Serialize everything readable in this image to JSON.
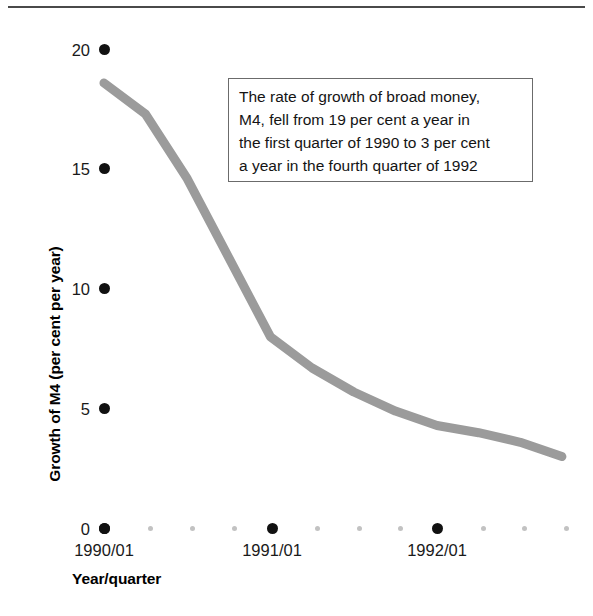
{
  "figure": {
    "has_top_rule": true,
    "background_color": "#ffffff",
    "line_color": "#9b9b9b",
    "major_dot_color": "#111111",
    "minor_dot_color": "#c2c2c2",
    "callout_border_color": "#6b6b6b"
  },
  "callout": {
    "lines": [
      "The rate of growth of broad money,",
      "M4, fell from 19 per cent a year in",
      "the first quarter of 1990 to 3 per cent",
      "a year in the fourth quarter of 1992"
    ]
  },
  "chart_data": {
    "type": "line",
    "title": "",
    "xlabel": "Year/quarter",
    "ylabel": "Growth of M4 (per cent per year)",
    "ylim": [
      0,
      20
    ],
    "yticks": [
      0,
      5,
      10,
      15,
      20
    ],
    "ytick_labels": [
      "0",
      "5",
      "10",
      "15",
      "20"
    ],
    "grid": false,
    "legend": "none",
    "x": [
      "1990/01",
      "1990/02",
      "1990/03",
      "1990/04",
      "1991/01",
      "1991/02",
      "1991/03",
      "1991/04",
      "1992/01",
      "1992/02",
      "1992/03",
      "1992/04"
    ],
    "xtick_labels": [
      "1990/01",
      "1991/01",
      "1992/01"
    ],
    "xtick_major_indices": [
      0,
      4,
      8
    ],
    "values": [
      18.6,
      17.3,
      14.6,
      11.3,
      8.0,
      6.7,
      5.7,
      4.9,
      4.3,
      4.0,
      3.6,
      3.0
    ],
    "series": [
      {
        "name": "Growth of M4",
        "values": [
          18.6,
          17.3,
          14.6,
          11.3,
          8.0,
          6.7,
          5.7,
          4.9,
          4.3,
          4.0,
          3.6,
          3.0
        ]
      }
    ],
    "annotations": [
      {
        "text": "The rate of growth of broad money, M4, fell from 19 per cent a year in the first quarter of 1990 to 3 per cent a year in the fourth quarter of 1992"
      }
    ]
  }
}
